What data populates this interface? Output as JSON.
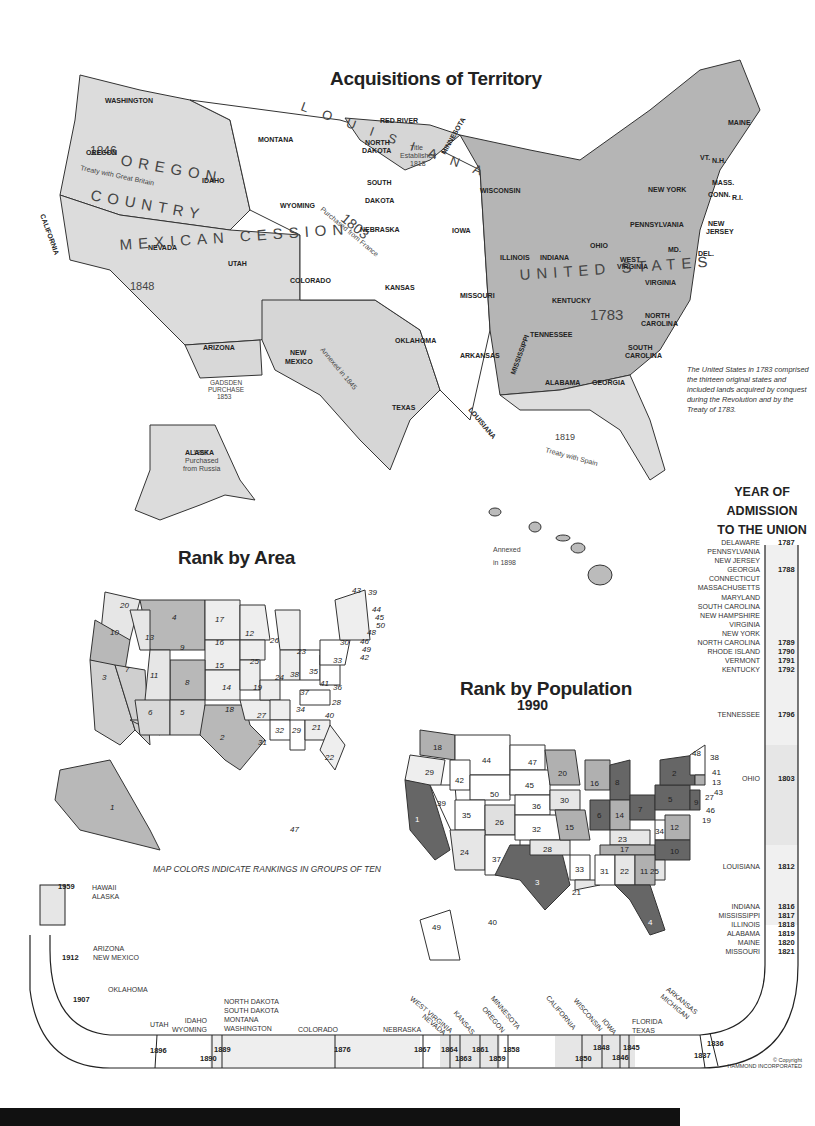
{
  "titles": {
    "main": "Acquisitions of Territory",
    "area": "Rank by Area",
    "population": "Rank by Population",
    "population_year": "1990",
    "admission_line1": "YEAR OF",
    "admission_line2": "ADMISSION",
    "admission_line3": "TO THE UNION"
  },
  "acquisitions": {
    "oregon": {
      "name": "OREGON COUNTRY",
      "year": "1846",
      "note": "Treaty with Great Britain"
    },
    "louisiana": {
      "name": "LOUISIANA",
      "year": "1803",
      "note": "Purchased from France"
    },
    "mexican": {
      "name": "MEXICAN CESSION",
      "year": "1848"
    },
    "texas": {
      "name": "TEXAS",
      "note": "Annexed in 1845"
    },
    "gadsden": {
      "name": "GADSDEN PURCHASE",
      "year": "1853"
    },
    "florida": {
      "name": "FLORIDA",
      "year": "1819",
      "note": "Treaty with Spain"
    },
    "red_river": {
      "name": "RED RIVER",
      "note": "Title Established 1818"
    },
    "united_states": {
      "name": "UNITED STATES",
      "year": "1783"
    },
    "alaska": {
      "name": "ALASKA",
      "year": "1867",
      "note": "Purchased from Russia"
    },
    "hawaii": {
      "name": "HAWAII",
      "note": "Annexed in 1898"
    }
  },
  "state_labels": [
    "WASHINGTON",
    "OREGON",
    "IDAHO",
    "MONTANA",
    "WYOMING",
    "NEVADA",
    "UTAH",
    "COLORADO",
    "ARIZONA",
    "NEW MEXICO",
    "CALIFORNIA",
    "NORTH DAKOTA",
    "SOUTH DAKOTA",
    "NEBRASKA",
    "KANSAS",
    "OKLAHOMA",
    "TEXAS",
    "MINNESOTA",
    "IOWA",
    "MISSOURI",
    "ARKANSAS",
    "LOUISIANA",
    "WISCONSIN",
    "MICHIGAN",
    "ILLINOIS",
    "INDIANA",
    "OHIO",
    "KENTUCKY",
    "TENNESSEE",
    "MISSISSIPPI",
    "ALABAMA",
    "GEORGIA",
    "FLORIDA",
    "SOUTH CAROLINA",
    "NORTH CAROLINA",
    "VIRGINIA",
    "WEST VIRGINIA",
    "PENNSYLVANIA",
    "NEW YORK",
    "MAINE",
    "VT.",
    "N.H.",
    "MASS.",
    "CONN.",
    "R.I.",
    "NEW JERSEY",
    "DEL.",
    "MD."
  ],
  "caption": "The United States in 1783 comprised the thirteen original states and included lands acquired by conquest during the Revolution and by the Treaty of 1783.",
  "rank_area": {
    "WA": 20,
    "OR": 10,
    "CA": 3,
    "NV": 7,
    "ID": 13,
    "MT": 4,
    "WY": 9,
    "UT": 11,
    "CO": 8,
    "AZ": 6,
    "NM": 5,
    "TX": 2,
    "ND": 17,
    "SD": 16,
    "NE": 15,
    "KS": 14,
    "OK": 18,
    "MN": 12,
    "IA": 25,
    "MO": 19,
    "AR": 27,
    "LA": 31,
    "WI": 26,
    "MI": 23,
    "IL": 24,
    "IN": 38,
    "OH": 35,
    "KY": 37,
    "TN": 34,
    "MS": 32,
    "AL": 29,
    "GA": 21,
    "FL": 22,
    "SC": 40,
    "NC": 28,
    "VA": 36,
    "WV": 41,
    "PA": 33,
    "NY": 30,
    "ME": 39,
    "VT": 43,
    "NH": 44,
    "MA": 45,
    "CT": 48,
    "RI": 50,
    "NJ": 46,
    "DE": 49,
    "MD": 42,
    "AK": 1,
    "HI": 47
  },
  "rank_population": {
    "WA": 18,
    "OR": 29,
    "CA": 1,
    "NV": 39,
    "ID": 42,
    "MT": 44,
    "WY": 50,
    "UT": 35,
    "CO": 26,
    "AZ": 24,
    "NM": 37,
    "TX": 3,
    "ND": 47,
    "SD": 45,
    "NE": 36,
    "KS": 32,
    "OK": 28,
    "MN": 20,
    "IA": 30,
    "MO": 15,
    "AR": 33,
    "LA": 21,
    "WI": 16,
    "MI": 8,
    "IL": 6,
    "IN": 14,
    "OH": 7,
    "KY": 23,
    "TN": 17,
    "MS": 31,
    "AL": 22,
    "GA": 11,
    "FL": 4,
    "SC": 25,
    "NC": 10,
    "VA": 12,
    "WV": 34,
    "PA": 5,
    "NY": 2,
    "ME": 38,
    "VT": 48,
    "NH": 41,
    "MA": 13,
    "CT": 27,
    "RI": 43,
    "NJ": 9,
    "DE": 46,
    "MD": 19,
    "AK": 49,
    "HI": 40
  },
  "legend_note": "MAP COLORS INDICATE RANKINGS IN GROUPS OF TEN",
  "admission": {
    "right_states": [
      "DELAWARE",
      "PENNSYLVANIA",
      "NEW JERSEY",
      "GEORGIA",
      "CONNECTICUT",
      "MASSACHUSETTS",
      "MARYLAND",
      "SOUTH CAROLINA",
      "NEW HAMPSHIRE",
      "VIRGINIA",
      "NEW YORK",
      "NORTH CAROLINA",
      "RHODE ISLAND",
      "VERMONT",
      "KENTUCKY"
    ],
    "right_years": {
      "y1787": "1787",
      "y1788": "1788",
      "y1789": "1789",
      "y1790": "1790",
      "y1791": "1791",
      "y1792": "1792"
    },
    "tennessee": "TENNESSEE",
    "y1796": "1796",
    "ohio": "OHIO",
    "y1803": "1803",
    "louisiana": "LOUISIANA",
    "y1812": "1812",
    "lower_states": [
      "INDIANA",
      "MISSISSIPPI",
      "ILLINOIS",
      "ALABAMA",
      "MAINE",
      "MISSOURI"
    ],
    "lower_years": [
      "1816",
      "1817",
      "1818",
      "1819",
      "1820",
      "1821"
    ],
    "arkansas": "ARKANSAS",
    "michigan": "MICHIGAN",
    "y1836": "1836",
    "y1837": "1837",
    "florida": "FLORIDA",
    "texas": "TEXAS",
    "y1845": "1845",
    "iowa": "IOWA",
    "y1846": "1846",
    "wisconsin": "WISCONSIN",
    "y1848": "1848",
    "california": "CALIFORNIA",
    "y1850": "1850",
    "minnesota": "MINNESOTA",
    "y1858": "1858",
    "oregon": "OREGON",
    "y1859": "1859",
    "kansas": "KANSAS",
    "y1861": "1861",
    "west_virginia": "WEST VIRGINIA",
    "y1863": "1863",
    "nevada": "NEVADA",
    "y1864": "1864",
    "nebraska": "NEBRASKA",
    "y1867": "1867",
    "colorado": "COLORADO",
    "y1876": "1876",
    "nd_sd_mt_wa": [
      "NORTH DAKOTA",
      "SOUTH DAKOTA",
      "MONTANA",
      "WASHINGTON"
    ],
    "y1889": "1889",
    "idaho": "IDAHO",
    "wyoming": "WYOMING",
    "y1890": "1890",
    "utah": "UTAH",
    "y1896": "1896",
    "oklahoma": "OKLAHOMA",
    "y1907": "1907",
    "arizona": "ARIZONA",
    "new_mexico": "NEW MEXICO",
    "y1912": "1912",
    "hawaii": "HAWAII",
    "alaska": "ALASKA",
    "y1959": "1959"
  },
  "copyright": {
    "line1": "© Copyright",
    "line2": "HAMMOND INCORPORATED"
  }
}
